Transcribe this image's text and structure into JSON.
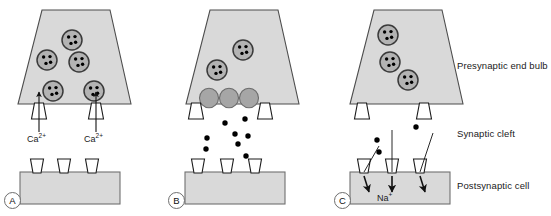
{
  "figure": {
    "width": 551,
    "height": 216,
    "background": "#ffffff"
  },
  "colors": {
    "bulb_fill": "#d9d9d9",
    "bulb_stroke": "#4d4d4d",
    "cell_fill": "#d9d9d9",
    "cell_stroke": "#707070",
    "vesicle_fill": "#b3b3b3",
    "vesicle_stroke": "#3a3a3a",
    "fused_vesicle_fill": "#a6a6a6",
    "fused_vesicle_stroke": "#6b6b6b",
    "channel_fill": "#ffffff",
    "channel_stroke": "#1a1a1a",
    "neurotransmitter": "#000000",
    "arrow": "#111111",
    "text": "#1a1a1a",
    "letter_circle_stroke": "#6e6e6e"
  },
  "side_labels": [
    {
      "id": "presynaptic-end-bulb",
      "text": "Presynaptic end bulb",
      "x": 457,
      "y": 60
    },
    {
      "id": "synaptic-cleft",
      "text": "Synaptic cleft",
      "x": 457,
      "y": 128
    },
    {
      "id": "postsynaptic-cell",
      "text": "Postsynaptic cell",
      "x": 457,
      "y": 180
    }
  ],
  "panels": [
    {
      "id": "panel-a",
      "letter": "A",
      "letter_x": 4,
      "letter_y": 192,
      "caption": "Calcium influx through voltage-gated channels",
      "bulb": {
        "x_left_bottom": 18,
        "x_right_bottom": 131,
        "x_left_top": 42,
        "x_right_top": 110,
        "y_top": 10,
        "y_bottom": 104
      },
      "vesicles": [
        {
          "cx": 72,
          "cy": 40,
          "r": 10
        },
        {
          "cx": 47,
          "cy": 60,
          "r": 10
        },
        {
          "cx": 79,
          "cy": 62,
          "r": 10
        },
        {
          "cx": 53,
          "cy": 91,
          "r": 10
        },
        {
          "cx": 94,
          "cy": 91,
          "r": 10
        }
      ],
      "fused_vesicles": [],
      "presynaptic_channels": [
        {
          "cx": 39,
          "cy": 104,
          "w_top": 9,
          "w_bottom": 15,
          "h": 16
        },
        {
          "cx": 96,
          "cy": 104,
          "w_top": 9,
          "w_bottom": 15,
          "h": 16
        }
      ],
      "calcium_arrows": [
        {
          "x": 39,
          "y_from": 132,
          "y_to": 92
        },
        {
          "x": 96,
          "y_from": 132,
          "y_to": 92
        }
      ],
      "ion_labels": [
        {
          "id": "calcium-label-left",
          "text": "Ca",
          "charge": "2+",
          "x": 27,
          "y": 134
        },
        {
          "id": "calcium-label-right",
          "text": "Ca",
          "charge": "2+",
          "x": 84,
          "y": 134
        }
      ],
      "neurotransmitters": [],
      "cell": {
        "x": 20,
        "y": 172,
        "w": 100,
        "h": 32
      },
      "receptors": [
        {
          "cx": 37,
          "w_top": 13,
          "w_bottom": 8,
          "h": 14
        },
        {
          "cx": 64,
          "w_top": 13,
          "w_bottom": 8,
          "h": 14
        },
        {
          "cx": 92,
          "w_top": 13,
          "w_bottom": 8,
          "h": 14
        }
      ],
      "receptor_bound": [],
      "entry_lines": [],
      "sodium_arrows": [],
      "sodium_label": null
    },
    {
      "id": "panel-b",
      "letter": "B",
      "letter_x": 168,
      "letter_y": 192,
      "caption": "Vesicle fusion and neurotransmitter release into cleft",
      "bulb": {
        "x_left_bottom": 186,
        "x_right_bottom": 299,
        "x_left_top": 210,
        "x_right_top": 278,
        "y_top": 10,
        "y_bottom": 104
      },
      "vesicles": [
        {
          "cx": 243,
          "cy": 50,
          "r": 10
        },
        {
          "cx": 217,
          "cy": 70,
          "r": 10
        }
      ],
      "fused_vesicles": [
        {
          "cx": 209,
          "cy": 98,
          "r": 9.5
        },
        {
          "cx": 229,
          "cy": 98,
          "r": 9.5
        },
        {
          "cx": 249,
          "cy": 98,
          "r": 9.5
        }
      ],
      "presynaptic_channels": [
        {
          "cx": 196,
          "cy": 104,
          "w_top": 9,
          "w_bottom": 15,
          "h": 16
        },
        {
          "cx": 265,
          "cy": 104,
          "w_top": 9,
          "w_bottom": 15,
          "h": 16
        }
      ],
      "calcium_arrows": [],
      "ion_labels": [],
      "neurotransmitters": [
        {
          "cx": 245,
          "cy": 119,
          "r": 2.7
        },
        {
          "cx": 225,
          "cy": 123,
          "r": 2.7
        },
        {
          "cx": 235,
          "cy": 134,
          "r": 2.7
        },
        {
          "cx": 248,
          "cy": 136,
          "r": 2.7
        },
        {
          "cx": 238,
          "cy": 144,
          "r": 2.7
        },
        {
          "cx": 207,
          "cy": 138,
          "r": 2.7
        },
        {
          "cx": 206,
          "cy": 149,
          "r": 2.7
        },
        {
          "cx": 246,
          "cy": 156,
          "r": 2.7
        },
        {
          "cx": 196,
          "cy": 168,
          "r": 2.7
        }
      ],
      "cell": {
        "x": 185,
        "y": 172,
        "w": 100,
        "h": 32
      },
      "receptors": [
        {
          "cx": 198,
          "w_top": 13,
          "w_bottom": 8,
          "h": 14
        },
        {
          "cx": 227,
          "w_top": 13,
          "w_bottom": 8,
          "h": 14
        },
        {
          "cx": 255,
          "w_top": 13,
          "w_bottom": 8,
          "h": 14
        }
      ],
      "receptor_bound": [],
      "entry_lines": [],
      "sodium_arrows": [],
      "sodium_label": null
    },
    {
      "id": "panel-c",
      "letter": "C",
      "letter_x": 334,
      "letter_y": 192,
      "caption": "Neurotransmitter binds receptors and sodium enters cell",
      "bulb": {
        "x_left_bottom": 350,
        "x_right_bottom": 463,
        "x_left_top": 374,
        "x_right_top": 442,
        "y_top": 10,
        "y_bottom": 104
      },
      "vesicles": [
        {
          "cx": 388,
          "cy": 35,
          "r": 10
        },
        {
          "cx": 390,
          "cy": 62,
          "r": 10
        },
        {
          "cx": 408,
          "cy": 80,
          "r": 10
        }
      ],
      "fused_vesicles": [],
      "presynaptic_channels": [
        {
          "cx": 362,
          "cy": 104,
          "w_top": 9,
          "w_bottom": 15,
          "h": 16
        },
        {
          "cx": 424,
          "cy": 104,
          "w_top": 9,
          "w_bottom": 15,
          "h": 16
        }
      ],
      "calcium_arrows": [],
      "ion_labels": [],
      "neurotransmitters": [
        {
          "cx": 416,
          "cy": 127,
          "r": 2.7
        },
        {
          "cx": 377,
          "cy": 140,
          "r": 2.7
        },
        {
          "cx": 379,
          "cy": 152,
          "r": 2.7
        }
      ],
      "cell": {
        "x": 350,
        "y": 172,
        "w": 100,
        "h": 32
      },
      "receptors": [
        {
          "cx": 364,
          "w_top": 13,
          "w_bottom": 8,
          "h": 14
        },
        {
          "cx": 392,
          "w_top": 13,
          "w_bottom": 8,
          "h": 14
        },
        {
          "cx": 420,
          "w_top": 13,
          "w_bottom": 8,
          "h": 14
        }
      ],
      "receptor_bound": [],
      "entry_lines": [
        {
          "x1": 379,
          "y1": 146,
          "x2": 364,
          "y2": 172
        },
        {
          "x1": 392,
          "y1": 130,
          "x2": 392,
          "y2": 172
        },
        {
          "x1": 433,
          "y1": 133,
          "x2": 420,
          "y2": 172
        }
      ],
      "sodium_arrows": [
        {
          "x_from": 364,
          "y_from": 176,
          "x_to": 369,
          "y_to": 192
        },
        {
          "x_from": 392,
          "y_from": 176,
          "x_to": 392,
          "y_to": 192
        },
        {
          "x_from": 420,
          "y_from": 176,
          "x_to": 425,
          "y_to": 192
        }
      ],
      "sodium_label": {
        "id": "sodium-label",
        "text": "Na",
        "charge": "+",
        "x": 377,
        "y": 193
      }
    }
  ]
}
